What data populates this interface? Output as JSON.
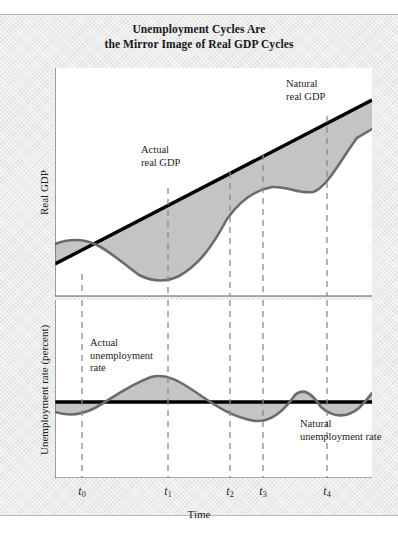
{
  "figure": {
    "title_line_1": "Unemployment Cycles Are",
    "title_line_2": "the Mirror Image of Real GDP Cycles"
  },
  "axes": {
    "top_y_label": "Real GDP",
    "bottom_y_label": "Unemployment rate (percent)",
    "x_label": "Time"
  },
  "annotations": {
    "natural_gdp_line_1": "Natural",
    "natural_gdp_line_2": "real GDP",
    "actual_gdp_line_1": "Actual",
    "actual_gdp_line_2": "real GDP",
    "actual_unemployment_line_1": "Actual",
    "actual_unemployment_line_2": "unemployment",
    "actual_unemployment_line_3": "rate",
    "natural_unemployment_line_1": "Natural",
    "natural_unemployment_line_2": "unemployment rate"
  },
  "ticks": [
    {
      "label": "t",
      "sub": "0",
      "x": 82
    },
    {
      "label": "t",
      "sub": "1",
      "x": 168
    },
    {
      "label": "t",
      "sub": "2",
      "x": 230
    },
    {
      "label": "t",
      "sub": "3",
      "x": 263
    },
    {
      "label": "t",
      "sub": "4",
      "x": 327
    }
  ],
  "colors": {
    "paper": "#eeeeee",
    "plot_background": "#ffffff",
    "trend_line": "#000000",
    "cycle_curve": "#6b6b6b",
    "gap_fill": "#c4c4c4",
    "dashed_guide": "#8a8a8a",
    "axis": "#5a5a5a",
    "text": "#1b1d21"
  },
  "chart_data": [
    {
      "type": "line",
      "title": "Real GDP cycles",
      "xlabel": "Time",
      "ylabel": "Real GDP",
      "xlim": [
        0,
        317
      ],
      "ylim": [
        0,
        228
      ],
      "grid": false,
      "legend": "in-plot annotations",
      "series": [
        {
          "name": "Natural real GDP",
          "style": "thick solid black straight trend line",
          "points": [
            [
              0,
              196
            ],
            [
              317,
              32
            ]
          ]
        },
        {
          "name": "Actual real GDP",
          "style": "gray wavy curve oscillating about the trend",
          "points": [
            [
              0,
              176
            ],
            [
              12,
              172
            ],
            [
              24,
              171
            ],
            [
              36,
              174
            ],
            [
              48,
              181
            ],
            [
              60,
              190
            ],
            [
              72,
              199
            ],
            [
              84,
              207
            ],
            [
              96,
              212
            ],
            [
              108,
              214
            ],
            [
              113,
              213
            ],
            [
              124,
              208
            ],
            [
              136,
              197
            ],
            [
              148,
              183
            ],
            [
              160,
              167
            ],
            [
              172,
              151
            ],
            [
              184,
              137
            ],
            [
              196,
              127
            ],
            [
              208,
              121
            ],
            [
              217,
              119
            ],
            [
              228,
              121
            ],
            [
              238,
              125
            ],
            [
              248,
              127
            ],
            [
              258,
              124
            ],
            [
              268,
              115
            ],
            [
              278,
              102
            ],
            [
              288,
              87
            ],
            [
              298,
              74
            ],
            [
              308,
              65
            ],
            [
              317,
              61
            ]
          ]
        }
      ],
      "shaded_regions": [
        {
          "name": "gap-before-t0-above-trend",
          "from_x": 0,
          "to_x": 82,
          "sign": "actual above natural"
        },
        {
          "name": "gap-t0-to-t1-below-trend",
          "from_x": 82,
          "to_x": 168,
          "sign": "actual below natural"
        },
        {
          "name": "gap-t1-to-t2-above-trend",
          "from_x": 168,
          "to_x": 230,
          "sign": "actual above natural"
        },
        {
          "name": "gap-t2-to-t3-below-trend",
          "from_x": 230,
          "to_x": 263,
          "sign": "actual below natural"
        },
        {
          "name": "gap-t3-to-t4-above-trend",
          "from_x": 263,
          "to_x": 327,
          "sign": "actual above natural"
        },
        {
          "name": "gap-after-t4-below-trend",
          "from_x": 327,
          "to_x": 317,
          "sign": "actual below natural"
        }
      ]
    },
    {
      "type": "line",
      "title": "Unemployment rate cycles",
      "xlabel": "Time",
      "ylabel": "Unemployment rate (percent)",
      "xlim": [
        0,
        317
      ],
      "ylim": [
        0,
        178
      ],
      "grid": false,
      "legend": "in-plot annotations",
      "series": [
        {
          "name": "Natural unemployment rate",
          "style": "thick solid black horizontal line",
          "points": [
            [
              0,
              102
            ],
            [
              317,
              102
            ]
          ]
        },
        {
          "name": "Actual unemployment rate",
          "style": "gray wavy curve mirroring the real GDP cycle",
          "points": [
            [
              0,
              112
            ],
            [
              12,
              115
            ],
            [
              24,
              115
            ],
            [
              36,
              111
            ],
            [
              48,
              105
            ],
            [
              60,
              97
            ],
            [
              72,
              88
            ],
            [
              84,
              81
            ],
            [
              96,
              77
            ],
            [
              106,
              76
            ],
            [
              118,
              79
            ],
            [
              130,
              85
            ],
            [
              142,
              93
            ],
            [
              154,
              100
            ],
            [
              166,
              107
            ],
            [
              178,
              114
            ],
            [
              190,
              119
            ],
            [
              200,
              121
            ],
            [
              210,
              119
            ],
            [
              220,
              114
            ],
            [
              228,
              107
            ],
            [
              234,
              100
            ],
            [
              240,
              95
            ],
            [
              246,
              93
            ],
            [
              252,
              95
            ],
            [
              258,
              100
            ],
            [
              266,
              107
            ],
            [
              276,
              113
            ],
            [
              286,
              116
            ],
            [
              296,
              114
            ],
            [
              304,
              108
            ],
            [
              312,
              99
            ],
            [
              317,
              93
            ]
          ]
        }
      ],
      "shaded_regions": [
        {
          "name": "below-natural-before-t0",
          "from_x": 0,
          "to_x": 82,
          "sign": "actual below natural"
        },
        {
          "name": "above-natural-t0-to-t1",
          "from_x": 82,
          "to_x": 168,
          "sign": "actual above natural"
        },
        {
          "name": "below-natural-t1-to-t2",
          "from_x": 168,
          "to_x": 230,
          "sign": "actual below natural"
        },
        {
          "name": "above-natural-t2-to-t3",
          "from_x": 230,
          "to_x": 263,
          "sign": "actual above natural"
        },
        {
          "name": "below-natural-t3-to-t4",
          "from_x": 263,
          "to_x": 327,
          "sign": "actual below natural"
        },
        {
          "name": "above-natural-after-t4",
          "from_x": 327,
          "to_x": 317,
          "sign": "actual above natural"
        }
      ]
    }
  ]
}
